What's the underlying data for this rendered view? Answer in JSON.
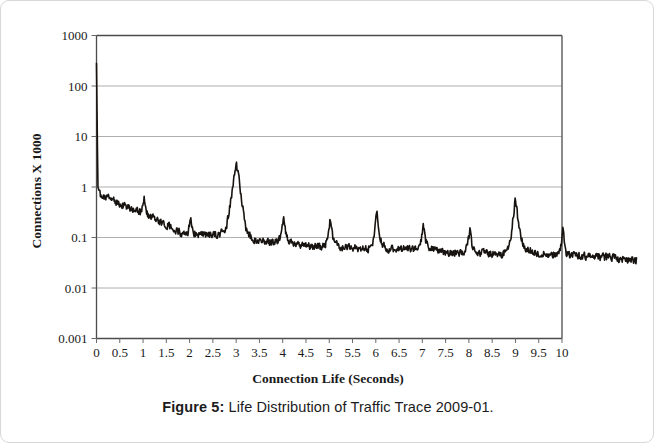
{
  "caption": {
    "label": "Figure 5:",
    "text": " Life Distribution of Traffic Trace 2009-01."
  },
  "chart_data": {
    "type": "line",
    "title": "",
    "xlabel": "Connection Life (Seconds)",
    "ylabel": "Connections X 1000",
    "xlim": [
      0,
      10
    ],
    "ylim": [
      0.001,
      1000
    ],
    "yscale": "log",
    "grid": true,
    "legend": "none",
    "series_color": "#171310",
    "xticks": [
      "0",
      "0.5",
      "1",
      "1.5",
      "2",
      "2.5",
      "3",
      "3.5",
      "4",
      "4.5",
      "5",
      "5.5",
      "6",
      "6.5",
      "7",
      "7.5",
      "8",
      "8.5",
      "9",
      "9.5",
      "10"
    ],
    "xtick_values": [
      0,
      0.5,
      1,
      1.5,
      2,
      2.5,
      3,
      3.5,
      4,
      4.5,
      5,
      5.5,
      6,
      6.5,
      7,
      7.5,
      8,
      8.5,
      9,
      9.5,
      10
    ],
    "yticks": [
      "1000",
      "100",
      "10",
      "1",
      "0.1",
      "0.01",
      "0.001"
    ],
    "ytick_values": [
      1000,
      100,
      10,
      1,
      0.1,
      0.01,
      0.001
    ],
    "x_overflow_max": 11.6,
    "series": [
      {
        "name": "Connections",
        "baseline_x": [
          0.0,
          0.03,
          0.08,
          0.15,
          0.25,
          0.4,
          0.55,
          0.7,
          0.85,
          1.0,
          1.15,
          1.3,
          1.5,
          1.7,
          1.9,
          2.05,
          2.2,
          2.4,
          2.6,
          2.8,
          2.95,
          3.05,
          3.2,
          3.4,
          3.6,
          3.8,
          4.05,
          4.3,
          4.6,
          4.9,
          5.05,
          5.3,
          5.6,
          5.9,
          6.05,
          6.3,
          6.6,
          6.9,
          7.05,
          7.4,
          7.8,
          8.05,
          8.4,
          8.7,
          8.95,
          9.1,
          9.4,
          9.7,
          10.0,
          10.3,
          10.7,
          11.1,
          11.6
        ],
        "baseline_y": [
          280.0,
          1.0,
          0.72,
          0.66,
          0.6,
          0.52,
          0.45,
          0.39,
          0.33,
          0.3,
          0.26,
          0.22,
          0.175,
          0.14,
          0.115,
          0.118,
          0.112,
          0.108,
          0.112,
          0.125,
          0.3,
          0.55,
          0.105,
          0.09,
          0.082,
          0.078,
          0.085,
          0.072,
          0.068,
          0.065,
          0.072,
          0.064,
          0.062,
          0.06,
          0.08,
          0.058,
          0.06,
          0.058,
          0.068,
          0.052,
          0.05,
          0.055,
          0.048,
          0.046,
          0.06,
          0.075,
          0.048,
          0.046,
          0.045,
          0.044,
          0.042,
          0.04,
          0.035
        ],
        "peaks": [
          {
            "x": 3.0,
            "value": 2.5,
            "width": 0.075
          },
          {
            "x": 4.02,
            "value": 0.175,
            "width": 0.045
          },
          {
            "x": 5.02,
            "value": 0.155,
            "width": 0.045
          },
          {
            "x": 6.02,
            "value": 0.25,
            "width": 0.045
          },
          {
            "x": 7.02,
            "value": 0.115,
            "width": 0.04
          },
          {
            "x": 8.02,
            "value": 0.085,
            "width": 0.04
          },
          {
            "x": 9.0,
            "value": 0.55,
            "width": 0.055
          },
          {
            "x": 10.02,
            "value": 0.145,
            "width": 0.03
          },
          {
            "x": 2.02,
            "value": 0.16,
            "width": 0.03
          },
          {
            "x": 1.02,
            "value": 0.32,
            "width": 0.03
          }
        ],
        "noise_amplitude": 0.17,
        "n_points": 1100
      }
    ]
  }
}
